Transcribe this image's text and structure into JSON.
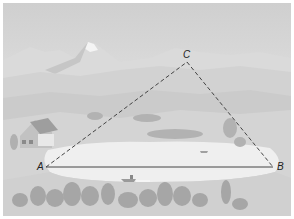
{
  "diagram": {
    "type": "triangle-over-landscape",
    "vertices": [
      {
        "id": "A",
        "label": "A",
        "x": 46,
        "y": 167
      },
      {
        "id": "B",
        "label": "B",
        "x": 273,
        "y": 167
      },
      {
        "id": "C",
        "label": "C",
        "x": 187,
        "y": 62
      }
    ],
    "edges": [
      {
        "from": "A",
        "to": "B",
        "style": "solid"
      },
      {
        "from": "A",
        "to": "C",
        "style": "dashed"
      },
      {
        "from": "C",
        "to": "B",
        "style": "dashed"
      }
    ],
    "scene_elements": [
      "mountains",
      "hills",
      "lake",
      "house",
      "trees",
      "boat"
    ],
    "colors": {
      "sky_top": "#d2d2d2",
      "sky_bottom": "#f0f0f0",
      "mountain_far": "#d6d6d6",
      "hills": "#cfcfcf",
      "lake": "#f2f2f2",
      "trees": "#a8a8a8",
      "line": "#444444"
    }
  }
}
